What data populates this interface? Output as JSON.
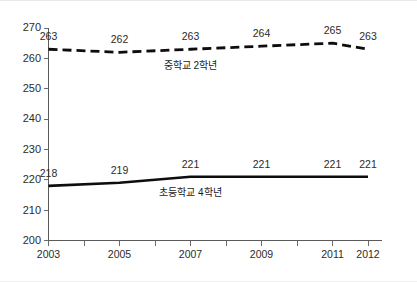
{
  "chart_data": {
    "type": "line",
    "title": "",
    "xlabel": "",
    "ylabel": "",
    "ylim": [
      200,
      270
    ],
    "ytick_values": [
      200,
      210,
      220,
      230,
      240,
      250,
      260,
      270
    ],
    "ytick_labels": [
      "200",
      "210",
      "220",
      "230",
      "240",
      "250",
      "260",
      "270"
    ],
    "x": [
      2003,
      2005,
      2007,
      2009,
      2011,
      2012
    ],
    "xtick_all": [
      2003,
      2004,
      2005,
      2006,
      2007,
      2008,
      2009,
      2010,
      2011,
      2012
    ],
    "xtick_labels": [
      "2003",
      "2005",
      "2007",
      "2009",
      "2011",
      "2012"
    ],
    "xtick_labeled_values": [
      2003,
      2005,
      2007,
      2009,
      2011,
      2012
    ],
    "xlim": [
      2003,
      2012
    ],
    "grid": false,
    "legend_position": "inline-annotation",
    "series": [
      {
        "name": "중학교 2학년",
        "style": "dashed",
        "color": "#0d0d0d",
        "values": [
          263,
          262,
          263,
          264,
          265,
          263
        ],
        "value_labels": [
          "263",
          "262",
          "263",
          "264",
          "265",
          "263"
        ],
        "label_anchor_x": 2007.0,
        "label_anchor_y": 256.6
      },
      {
        "name": "초등학교 4학년",
        "style": "solid",
        "color": "#0d0d0d",
        "values": [
          218,
          219,
          221,
          221,
          221,
          221
        ],
        "value_labels": [
          "218",
          "219",
          "221",
          "221",
          "221",
          "221"
        ],
        "label_anchor_x": 2007.0,
        "label_anchor_y": 214.6
      }
    ]
  },
  "colors": {
    "background": "#ffffff",
    "axis": "#5a5a5a",
    "text": "#2b2b2b",
    "series": "#0d0d0d"
  }
}
